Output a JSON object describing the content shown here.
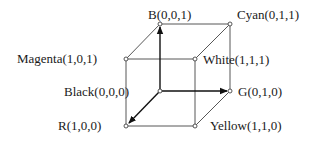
{
  "diagram": {
    "vertices": [
      {
        "id": "black",
        "label": "Black(0,0,0)",
        "x": 160,
        "y": 91
      },
      {
        "id": "r",
        "label": "R(1,0,0)",
        "x": 126,
        "y": 126
      },
      {
        "id": "g",
        "label": "G(0,1,0)",
        "x": 230,
        "y": 91
      },
      {
        "id": "b",
        "label": "B(0,0,1)",
        "x": 160,
        "y": 24
      },
      {
        "id": "yellow",
        "label": "Yellow(1,1,0)",
        "x": 195,
        "y": 126
      },
      {
        "id": "magenta",
        "label": "Magenta(1,0,1)",
        "x": 126,
        "y": 59
      },
      {
        "id": "cyan",
        "label": "Cyan(0,1,1)",
        "x": 230,
        "y": 24
      },
      {
        "id": "white",
        "label": "White(1,1,1)",
        "x": 195,
        "y": 59
      }
    ],
    "axes": [
      {
        "from": "black",
        "to": "r",
        "label": "R axis"
      },
      {
        "from": "black",
        "to": "g",
        "label": "G axis"
      },
      {
        "from": "black",
        "to": "b",
        "label": "B axis"
      }
    ],
    "colors": {
      "line": "#333333",
      "arrow": "#111111",
      "vertex_fill": "#ffffff"
    }
  }
}
